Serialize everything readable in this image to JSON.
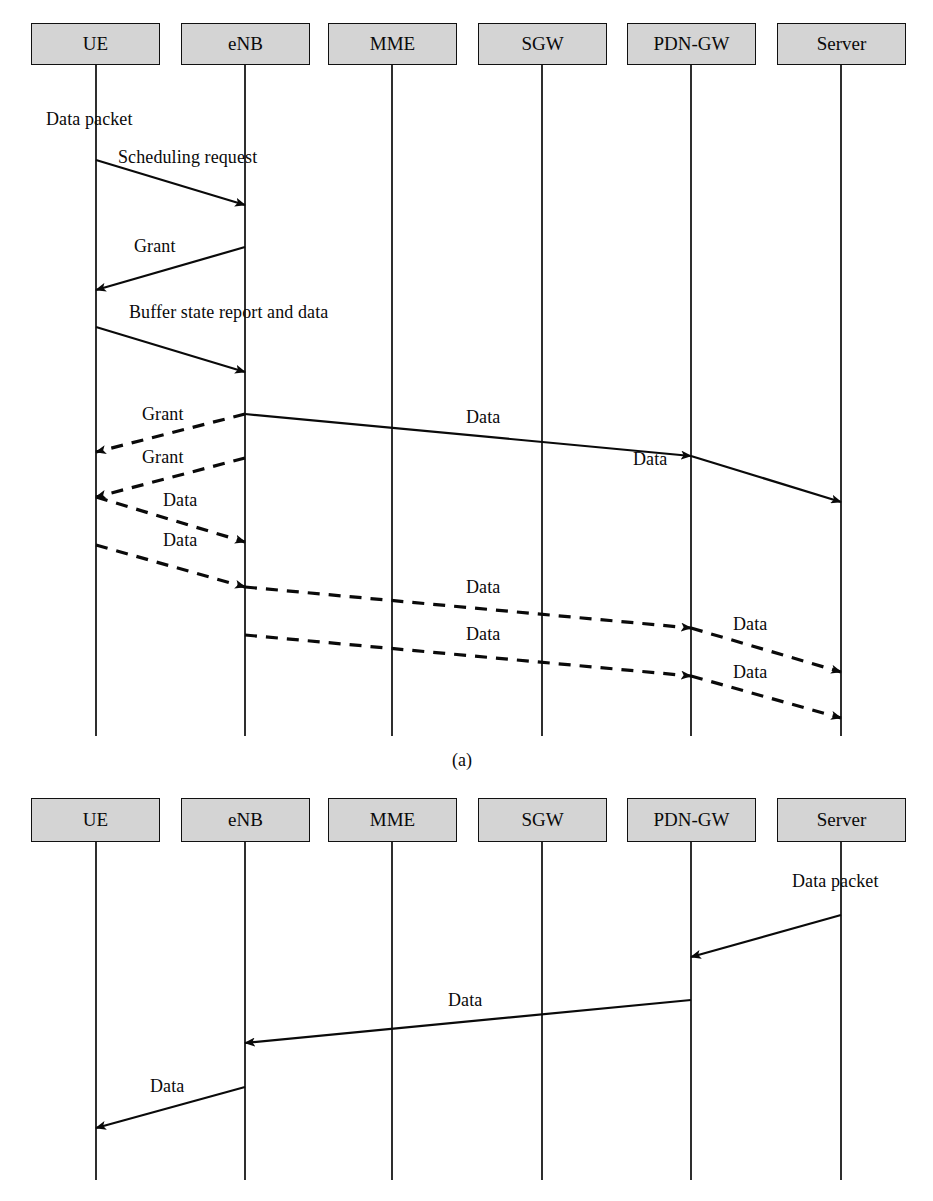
{
  "figure": {
    "type": "sequence-diagram",
    "caption_a": "(a)",
    "style": {
      "node_fill": "#d4d4d4",
      "node_stroke": "#111111",
      "line_color": "#0a0a0a",
      "background": "#ffffff"
    }
  },
  "diagram_a": {
    "id": "a",
    "nodes": [
      {
        "key": "ue",
        "label": "UE",
        "x": 96,
        "box_left": 31,
        "box_width": 129
      },
      {
        "key": "enb",
        "label": "eNB",
        "x": 245,
        "box_left": 181,
        "box_width": 129
      },
      {
        "key": "mme",
        "label": "MME",
        "x": 392,
        "box_left": 328,
        "box_width": 129
      },
      {
        "key": "sgw",
        "label": "SGW",
        "x": 542,
        "box_left": 478,
        "box_width": 129
      },
      {
        "key": "pdngw",
        "label": "PDN-GW",
        "x": 691,
        "box_left": 627,
        "box_width": 129
      },
      {
        "key": "server",
        "label": "Server",
        "x": 841,
        "box_left": 777,
        "box_width": 129
      }
    ],
    "box_top": 23,
    "box_height": 42,
    "lifeline_bottom": 736,
    "messages": [
      {
        "label": "Data packet",
        "from": "ue",
        "to": "ue",
        "kind": "annotation",
        "label_x": 46,
        "label_y": 118,
        "style": "none"
      },
      {
        "label": "Scheduling request",
        "from": "ue",
        "to": "enb",
        "y1": 160,
        "y2": 205,
        "style": "solid",
        "label_x": 118,
        "label_y": 157
      },
      {
        "label": "Grant",
        "from": "enb",
        "to": "ue",
        "y1": 247,
        "y2": 290,
        "style": "solid",
        "label_x": 134,
        "label_y": 246
      },
      {
        "label": "Buffer state report and data",
        "from": "ue",
        "to": "enb",
        "y1": 327,
        "y2": 372,
        "style": "solid",
        "label_x": 129,
        "label_y": 312
      },
      {
        "label": "Grant",
        "from": "enb",
        "to": "ue",
        "y1": 414,
        "y2": 452,
        "style": "dashed",
        "label_x": 142,
        "label_y": 414
      },
      {
        "label": "Data",
        "from": "enb",
        "to": "pdngw",
        "y1": 414,
        "y2": 456,
        "style": "solid",
        "label_x": 466,
        "label_y": 417
      },
      {
        "label": "Data",
        "from": "pdngw",
        "to": "server",
        "y1": 456,
        "y2": 502,
        "style": "solid",
        "label_x": 633,
        "label_y": 458
      },
      {
        "label": "Grant",
        "from": "enb",
        "to": "ue",
        "y1": 458,
        "y2": 497,
        "style": "dashed",
        "label_x": 142,
        "label_y": 456
      },
      {
        "label": "Data",
        "from": "ue",
        "to": "enb",
        "y1": 497,
        "y2": 542,
        "style": "dashed",
        "label_x": 163,
        "label_y": 500
      },
      {
        "label": "Data",
        "from": "ue",
        "to": "enb",
        "y1": 545,
        "y2": 587,
        "style": "dashed",
        "label_x": 163,
        "label_y": 540
      },
      {
        "label": "Data",
        "from": "enb",
        "to": "pdngw",
        "y1": 587,
        "y2": 628,
        "style": "dashed",
        "label_x": 466,
        "label_y": 587
      },
      {
        "label": "Data",
        "from": "pdngw",
        "to": "server",
        "y1": 628,
        "y2": 672,
        "style": "dashed",
        "label_x": 633,
        "label_y": 624
      },
      {
        "label": "Data",
        "from": "enb",
        "to": "pdngw",
        "y1": 635,
        "y2": 676,
        "style": "dashed",
        "label_x": 466,
        "label_y": 634
      },
      {
        "label": "Data",
        "from": "pdngw",
        "to": "server",
        "y1": 676,
        "y2": 718,
        "style": "dashed",
        "label_x": 633,
        "label_y": 672
      }
    ]
  },
  "diagram_b": {
    "id": "b",
    "nodes": [
      {
        "key": "ue",
        "label": "UE",
        "x": 96,
        "box_left": 31,
        "box_width": 129
      },
      {
        "key": "enb",
        "label": "eNB",
        "x": 245,
        "box_left": 181,
        "box_width": 129
      },
      {
        "key": "mme",
        "label": "MME",
        "x": 392,
        "box_left": 328,
        "box_width": 129
      },
      {
        "key": "sgw",
        "label": "SGW",
        "x": 542,
        "box_left": 478,
        "box_width": 129
      },
      {
        "key": "pdngw",
        "label": "PDN-GW",
        "x": 691,
        "box_left": 627,
        "box_width": 129
      },
      {
        "key": "server",
        "label": "Server",
        "x": 841,
        "box_left": 777,
        "box_width": 129
      }
    ],
    "box_top": 798,
    "box_height": 44,
    "lifeline_bottom": 1180,
    "messages": [
      {
        "label": "Data packet",
        "from": "server",
        "to": "server",
        "kind": "annotation",
        "label_x": 792,
        "label_y": 880,
        "style": "none"
      },
      {
        "label": "",
        "from": "server",
        "to": "pdngw",
        "y1": 915,
        "y2": 957,
        "style": "solid",
        "label_x": 0,
        "label_y": 0
      },
      {
        "label": "Data",
        "from": "pdngw",
        "to": "enb",
        "y1": 1000,
        "y2": 1043,
        "style": "solid",
        "label_x": 448,
        "label_y": 1000
      },
      {
        "label": "Data",
        "from": "enb",
        "to": "ue",
        "y1": 1087,
        "y2": 1128,
        "style": "solid",
        "label_x": 150,
        "label_y": 1086
      }
    ]
  }
}
